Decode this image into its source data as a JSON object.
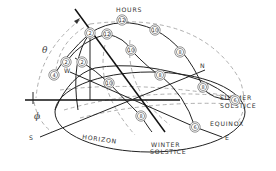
{
  "diagram": {
    "labels": {
      "hours": "HOURS",
      "summer_solstice_1": "SUMMER",
      "summer_solstice_2": "SOLSTICE",
      "equinox": "EQUINOX",
      "winter_solstice_1": "WINTER",
      "winter_solstice_2": "SOLSTICE",
      "horizon": "HORIZON",
      "south": "S",
      "east": "E",
      "west": "W",
      "north": "N",
      "theta": "θ",
      "phi": "ϕ"
    },
    "hour_markers": [
      {
        "label": "12",
        "x": 122,
        "y": 20
      },
      {
        "label": "2",
        "x": 90,
        "y": 33
      },
      {
        "label": "12",
        "x": 107,
        "y": 34
      },
      {
        "label": "10",
        "x": 155,
        "y": 30
      },
      {
        "label": "10",
        "x": 131,
        "y": 50
      },
      {
        "label": "2",
        "x": 66,
        "y": 62
      },
      {
        "label": "2",
        "x": 82,
        "y": 62
      },
      {
        "label": "4",
        "x": 54,
        "y": 75
      },
      {
        "label": "8",
        "x": 180,
        "y": 52
      },
      {
        "label": "10",
        "x": 109,
        "y": 83
      },
      {
        "label": "8",
        "x": 160,
        "y": 75
      },
      {
        "label": "8",
        "x": 203,
        "y": 87
      },
      {
        "label": "6",
        "x": 235,
        "y": 100
      },
      {
        "label": "8",
        "x": 141,
        "y": 116
      },
      {
        "label": "6",
        "x": 195,
        "y": 127
      }
    ]
  }
}
